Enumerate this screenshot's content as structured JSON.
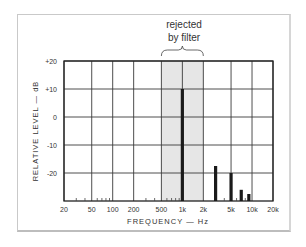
{
  "chart_data": {
    "type": "bar",
    "title": "",
    "annotation": {
      "line1": "rejected",
      "line2": "by filter",
      "band_hz": [
        500,
        2000
      ],
      "band_color": "#e6e6e6"
    },
    "xlabel": "FREQUENCY — Hz",
    "ylabel": "RELATIVE LEVEL — dB",
    "xscale": "log",
    "xlim": [
      20,
      20000
    ],
    "ylim": [
      -30,
      20
    ],
    "grid": true,
    "x_ticks": [
      {
        "hz": 20,
        "label": "20"
      },
      {
        "hz": 50,
        "label": "50"
      },
      {
        "hz": 100,
        "label": "100"
      },
      {
        "hz": 200,
        "label": "200"
      },
      {
        "hz": 500,
        "label": "500"
      },
      {
        "hz": 1000,
        "label": "1k"
      },
      {
        "hz": 2000,
        "label": "2k"
      },
      {
        "hz": 5000,
        "label": "5k"
      },
      {
        "hz": 10000,
        "label": "10k"
      },
      {
        "hz": 20000,
        "label": "20k"
      }
    ],
    "y_ticks": [
      {
        "db": 20,
        "label": "+20"
      },
      {
        "db": 10,
        "label": "+10"
      },
      {
        "db": 0,
        "label": "0"
      },
      {
        "db": -10,
        "label": "-10"
      },
      {
        "db": -20,
        "label": "-20"
      }
    ],
    "series": [
      {
        "name": "spectrum",
        "points": [
          {
            "hz": 1000,
            "db": 10
          },
          {
            "hz": 3000,
            "db": -17.5
          },
          {
            "hz": 5000,
            "db": -20
          },
          {
            "hz": 7000,
            "db": -26
          },
          {
            "hz": 9000,
            "db": -27.5
          }
        ]
      }
    ],
    "noise_ticks_hz": [
      30,
      40,
      60,
      70,
      80,
      90,
      300,
      400,
      600,
      700,
      800,
      900,
      4000,
      6000,
      8000
    ],
    "colors": {
      "bar": "#1a1a1a",
      "grid": "#3a3a3a",
      "text": "#333333"
    }
  }
}
